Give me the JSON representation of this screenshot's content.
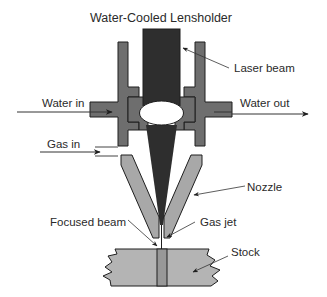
{
  "diagram": {
    "title": "Water-Cooled Lensholder",
    "labels": {
      "laser_beam": "Laser beam",
      "water_in": "Water in",
      "water_out": "Water out",
      "gas_in": "Gas in",
      "nozzle": "Nozzle",
      "focused_beam": "Focused beam",
      "gas_jet": "Gas jet",
      "stock": "Stock"
    },
    "colors": {
      "beam": "#2e2e2e",
      "holder": "#6e6e6e",
      "nozzle": "#a8a8a8",
      "stock": "#b4b4b4",
      "lens": "#ffffff",
      "outline": "#1e1e1e"
    }
  }
}
